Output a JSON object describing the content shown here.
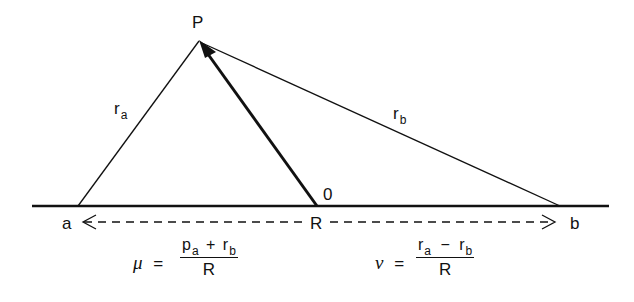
{
  "diagram": {
    "points": {
      "P": {
        "label": "P",
        "x": 199,
        "y": 40
      },
      "a": {
        "label": "a",
        "x": 78,
        "y": 206
      },
      "R": {
        "label": "R",
        "x": 317,
        "y": 206
      },
      "b": {
        "label": "b",
        "x": 560,
        "y": 206
      },
      "origin": {
        "label": "0"
      }
    },
    "edges": [
      {
        "from": "a",
        "to": "P",
        "label": "r",
        "subscript": "a"
      },
      {
        "from": "b",
        "to": "P",
        "label": "r",
        "subscript": "b"
      },
      {
        "from": "R",
        "to": "P",
        "style": "bold-arrow"
      }
    ],
    "baseline": {
      "x1": 32,
      "x2": 609,
      "y": 206
    },
    "dashed_axis": {
      "left_label": "a",
      "center_label": "R",
      "right_label": "b"
    },
    "equations": {
      "mu": {
        "symbol": "μ",
        "equals": "=",
        "num_p": "p",
        "num_p_sub": "a",
        "num_op": "+",
        "num_r": "r",
        "num_r_sub": "b",
        "denominator": "R"
      },
      "nu": {
        "symbol": "ν",
        "equals": "=",
        "num_r1": "r",
        "num_r1_sub": "a",
        "num_op": "−",
        "num_r2": "r",
        "num_r2_sub": "b",
        "denominator": "R"
      }
    }
  }
}
